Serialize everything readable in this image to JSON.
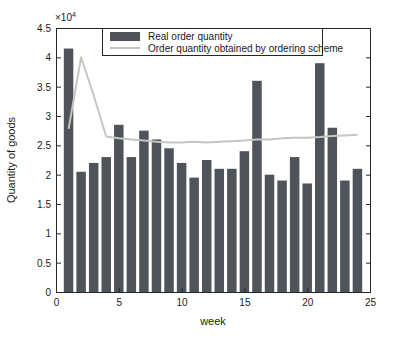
{
  "figure": {
    "ylabel": "Quantity of goods",
    "xlabel": "week",
    "y_exponent_base": "×10",
    "y_exponent_power": "4"
  },
  "legend": {
    "position": "north",
    "items": [
      {
        "label": "Real order quantity",
        "swatch": "bar",
        "color": "#4e545a"
      },
      {
        "label": "Order quantity obtained by ordering scheme",
        "swatch": "line",
        "color": "#c6c6c0"
      }
    ]
  },
  "colors": {
    "bar": "#4e545a",
    "line": "#c6c6c0",
    "axis": "#262626",
    "text": "#1a1a1a",
    "background": "#ffffff"
  },
  "chart_data": {
    "type": "bar",
    "title": "",
    "xlabel": "week",
    "ylabel": "Quantity of goods",
    "unit": "×10^4 goods",
    "xlim": [
      0,
      25
    ],
    "ylim": [
      0,
      4.5
    ],
    "xticks": [
      0,
      5,
      10,
      15,
      20,
      25
    ],
    "yticks": [
      0,
      0.5,
      1,
      1.5,
      2,
      2.5,
      3,
      3.5,
      4,
      4.5
    ],
    "grid": false,
    "x": [
      1,
      2,
      3,
      4,
      5,
      6,
      7,
      8,
      9,
      10,
      11,
      12,
      13,
      14,
      15,
      16,
      17,
      18,
      19,
      20,
      21,
      22,
      23,
      24
    ],
    "series": [
      {
        "name": "Real order quantity",
        "type": "bar",
        "values": [
          4.15,
          2.05,
          2.2,
          2.3,
          2.85,
          2.3,
          2.75,
          2.6,
          2.45,
          2.2,
          1.95,
          2.25,
          2.1,
          2.1,
          2.4,
          3.6,
          2.0,
          1.9,
          2.3,
          1.85,
          3.9,
          2.8,
          1.9,
          2.1
        ]
      },
      {
        "name": "Order quantity obtained by ordering scheme",
        "type": "line",
        "values": [
          2.78,
          4.0,
          3.35,
          2.65,
          2.62,
          2.6,
          2.58,
          2.56,
          2.55,
          2.55,
          2.56,
          2.55,
          2.56,
          2.57,
          2.58,
          2.6,
          2.6,
          2.62,
          2.63,
          2.63,
          2.64,
          2.66,
          2.67,
          2.68
        ]
      }
    ]
  }
}
